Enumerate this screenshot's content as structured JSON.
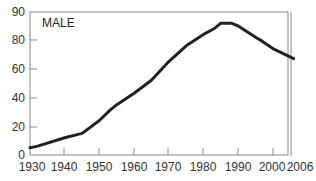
{
  "chart_data": {
    "type": "line",
    "title": "",
    "annotation": "MALE",
    "xlabel": "",
    "ylabel": "",
    "x_ticks": [
      1930,
      1940,
      1950,
      1960,
      1970,
      1980,
      1990,
      2000,
      2006
    ],
    "y_ticks": [
      0,
      20,
      40,
      60,
      80,
      90
    ],
    "xlim": [
      1930,
      2006
    ],
    "ylim": [
      0,
      90
    ],
    "grid": false,
    "legend": null,
    "series": [
      {
        "name": "MALE",
        "color": "#222222",
        "x": [
          1930,
          1932,
          1940,
          1945,
          1950,
          1953,
          1955,
          1960,
          1965,
          1970,
          1975,
          1980,
          1983,
          1985,
          1988,
          1990,
          1995,
          1997,
          2000,
          2006
        ],
        "values": [
          5,
          6,
          12,
          15,
          24,
          31,
          35,
          43,
          52,
          65,
          76,
          82,
          84,
          86,
          86,
          85,
          81,
          79,
          74,
          67
        ]
      }
    ]
  },
  "labels": {
    "annotation": "MALE",
    "y": [
      "0",
      "20",
      "40",
      "60",
      "80",
      "90"
    ],
    "x": [
      "1930",
      "1940",
      "1950",
      "1960",
      "1970",
      "1980",
      "1990",
      "2000",
      "2006"
    ]
  }
}
